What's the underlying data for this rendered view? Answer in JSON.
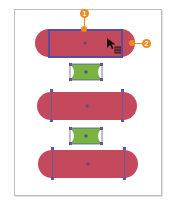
{
  "colors": {
    "pill_fill": "#c5495c",
    "bowtie_fill": "#7ab342",
    "selection": "#5a4ca0",
    "callout": "#f08a1c",
    "artboard_border": "#bdbdbd"
  },
  "callouts": [
    {
      "id": 1,
      "label": "1"
    },
    {
      "id": 2,
      "label": "2"
    }
  ],
  "shapes": [
    {
      "type": "pill",
      "state": "selected",
      "icon": "rounded-rectangle"
    },
    {
      "type": "bowtie",
      "icon": "concave-rectangle"
    },
    {
      "type": "pill",
      "icon": "rounded-rectangle"
    },
    {
      "type": "bowtie",
      "icon": "concave-rectangle"
    },
    {
      "type": "pill",
      "icon": "rounded-rectangle"
    }
  ],
  "cursor": {
    "icon": "arrow-scale-cursor"
  }
}
